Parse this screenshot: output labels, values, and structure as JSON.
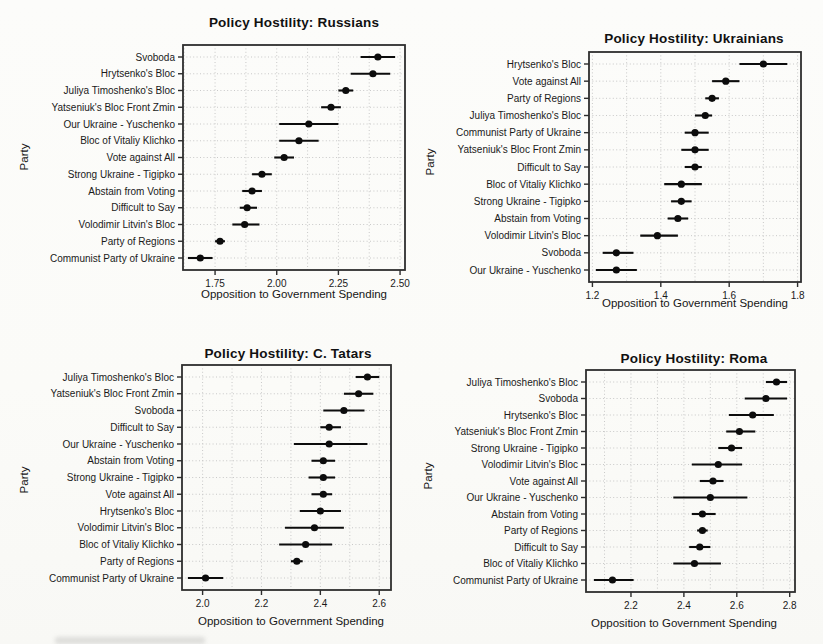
{
  "chart_data": [
    {
      "type": "scatter",
      "title": "Policy Hostility: Russians",
      "xlabel": "Opposition to Government Spending",
      "ylabel": "Party",
      "legend": "none",
      "grid": "dotted",
      "marker": "filled-circle-with-horizontal-error-bar",
      "xlim": [
        1.62,
        2.52
      ],
      "xticks": [
        1.75,
        2.0,
        2.25,
        2.5
      ],
      "xtick_labels": [
        "1.75",
        "2.00",
        "2.25",
        "2.50"
      ],
      "categories": [
        "Svoboda",
        "Hrytsenko's Bloc",
        "Juliya Timoshenko's Bloc",
        "Yatseniuk's Bloc Front Zmin",
        "Our Ukraine - Yuschenko",
        "Bloc of Vitaliy Klichko",
        "Vote against All",
        "Strong Ukraine - Tigipko",
        "Abstain from Voting",
        "Difficult to Say",
        "Volodimir Litvin's Bloc",
        "Party of Regions",
        "Communist Party of Ukraine"
      ],
      "values": [
        2.41,
        2.39,
        2.28,
        2.22,
        2.13,
        2.09,
        2.03,
        1.94,
        1.9,
        1.88,
        1.87,
        1.77,
        1.69
      ],
      "ci_low": [
        2.34,
        2.3,
        2.25,
        2.18,
        2.01,
        2.01,
        1.99,
        1.9,
        1.86,
        1.85,
        1.82,
        1.75,
        1.64
      ],
      "ci_high": [
        2.48,
        2.46,
        2.31,
        2.26,
        2.25,
        2.17,
        2.07,
        1.98,
        1.94,
        1.92,
        1.93,
        1.79,
        1.74
      ]
    },
    {
      "type": "scatter",
      "title": "Policy Hostility: Ukrainians",
      "xlabel": "Opposition to Government Spending",
      "ylabel": "Party",
      "legend": "none",
      "grid": "dotted",
      "marker": "filled-circle-with-horizontal-error-bar",
      "xlim": [
        1.19,
        1.81
      ],
      "xticks": [
        1.2,
        1.4,
        1.6,
        1.8
      ],
      "xtick_labels": [
        "1.2",
        "1.4",
        "1.6",
        "1.8"
      ],
      "categories": [
        "Hrytsenko's Bloc",
        "Vote against All",
        "Party of Regions",
        "Juliya Timoshenko's Bloc",
        "Communist Party of Ukraine",
        "Yatseniuk's Bloc Front Zmin",
        "Difficult to Say",
        "Bloc of Vitaliy Klichko",
        "Strong Ukraine - Tigipko",
        "Abstain from Voting",
        "Volodimir Litvin's Bloc",
        "Svoboda",
        "Our Ukraine - Yuschenko"
      ],
      "values": [
        1.7,
        1.59,
        1.55,
        1.53,
        1.5,
        1.5,
        1.5,
        1.46,
        1.46,
        1.45,
        1.39,
        1.27,
        1.27
      ],
      "ci_low": [
        1.63,
        1.55,
        1.53,
        1.5,
        1.47,
        1.46,
        1.47,
        1.41,
        1.43,
        1.42,
        1.34,
        1.23,
        1.21
      ],
      "ci_high": [
        1.77,
        1.63,
        1.57,
        1.55,
        1.54,
        1.54,
        1.52,
        1.52,
        1.49,
        1.48,
        1.45,
        1.32,
        1.33
      ]
    },
    {
      "type": "scatter",
      "title": "Policy Hostility: C. Tatars",
      "xlabel": "Opposition to Government Spending",
      "ylabel": "Party",
      "legend": "none",
      "grid": "dotted",
      "marker": "filled-circle-with-horizontal-error-bar",
      "xlim": [
        1.93,
        2.64
      ],
      "xticks": [
        2.0,
        2.2,
        2.4,
        2.6
      ],
      "xtick_labels": [
        "2.0",
        "2.2",
        "2.4",
        "2.6"
      ],
      "categories": [
        "Juliya Timoshenko's Bloc",
        "Yatseniuk's Bloc Front Zmin",
        "Svoboda",
        "Difficult to Say",
        "Our Ukraine - Yuschenko",
        "Abstain from Voting",
        "Strong Ukraine - Tigipko",
        "Vote against All",
        "Hrytsenko's Bloc",
        "Volodimir Litvin's Bloc",
        "Bloc of Vitaliy Klichko",
        "Party of Regions",
        "Communist Party of Ukraine"
      ],
      "values": [
        2.56,
        2.53,
        2.48,
        2.43,
        2.43,
        2.41,
        2.41,
        2.41,
        2.4,
        2.38,
        2.35,
        2.32,
        2.01
      ],
      "ci_low": [
        2.52,
        2.48,
        2.41,
        2.4,
        2.31,
        2.37,
        2.36,
        2.37,
        2.33,
        2.28,
        2.26,
        2.3,
        1.95
      ],
      "ci_high": [
        2.6,
        2.58,
        2.55,
        2.47,
        2.56,
        2.45,
        2.45,
        2.44,
        2.47,
        2.48,
        2.44,
        2.34,
        2.07
      ]
    },
    {
      "type": "scatter",
      "title": "Policy Hostility: Roma",
      "xlabel": "Opposition to Government Spending",
      "ylabel": "Party",
      "legend": "none",
      "grid": "dotted",
      "marker": "filled-circle-with-horizontal-error-bar",
      "xlim": [
        2.03,
        2.82
      ],
      "xticks": [
        2.2,
        2.4,
        2.6,
        2.8
      ],
      "xtick_labels": [
        "2.2",
        "2.4",
        "2.6",
        "2.8"
      ],
      "categories": [
        "Juliya Timoshenko's Bloc",
        "Svoboda",
        "Hrytsenko's Bloc",
        "Yatseniuk's Bloc Front Zmin",
        "Strong Ukraine - Tigipko",
        "Volodimir Litvin's Bloc",
        "Vote against All",
        "Our Ukraine - Yuschenko",
        "Abstain from Voting",
        "Party of Regions",
        "Difficult to Say",
        "Bloc of Vitaliy Klichko",
        "Communist Party of Ukraine"
      ],
      "values": [
        2.75,
        2.71,
        2.66,
        2.61,
        2.58,
        2.53,
        2.51,
        2.5,
        2.47,
        2.47,
        2.46,
        2.44,
        2.13
      ],
      "ci_low": [
        2.71,
        2.63,
        2.57,
        2.56,
        2.53,
        2.43,
        2.46,
        2.36,
        2.43,
        2.45,
        2.42,
        2.36,
        2.06
      ],
      "ci_high": [
        2.79,
        2.79,
        2.74,
        2.67,
        2.62,
        2.62,
        2.55,
        2.64,
        2.52,
        2.49,
        2.5,
        2.54,
        2.21
      ]
    }
  ]
}
